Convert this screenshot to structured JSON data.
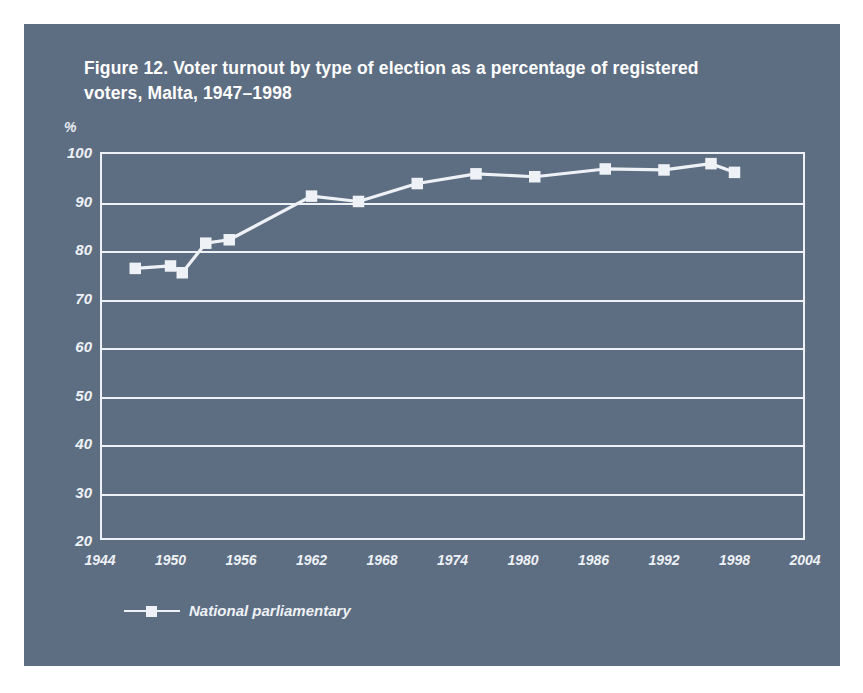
{
  "figure": {
    "title": "Figure 12. Voter turnout by type of election as a percentage of registered voters, Malta, 1947–1998",
    "panel_color": "#5d6d82",
    "ink_color": "#eef2f6"
  },
  "chart_data": {
    "type": "line",
    "title": "Figure 12. Voter turnout by type of election as a percentage of registered voters, Malta, 1947–1998",
    "xlabel": "",
    "ylabel": "%",
    "unit_label": "%",
    "xlim": [
      1944,
      2004
    ],
    "ylim": [
      20,
      100
    ],
    "xticks": [
      1944,
      1950,
      1956,
      1962,
      1968,
      1974,
      1980,
      1986,
      1992,
      1998,
      2004
    ],
    "yticks": [
      20,
      30,
      40,
      50,
      60,
      70,
      80,
      90,
      100
    ],
    "grid": "horizontal",
    "legend_position": "bottom-left",
    "series": [
      {
        "name": "National parliamentary",
        "marker": "square",
        "color": "#eef2f6",
        "x": [
          1947,
          1950,
          1951,
          1953,
          1955,
          1962,
          1966,
          1971,
          1976,
          1981,
          1987,
          1992,
          1996,
          1998
        ],
        "values": [
          76.0,
          76.5,
          75.1,
          81.2,
          81.9,
          90.9,
          89.8,
          93.5,
          95.5,
          94.9,
          96.5,
          96.3,
          97.6,
          95.8
        ]
      }
    ]
  },
  "legend": {
    "entries": [
      {
        "label": "National parliamentary"
      }
    ]
  }
}
